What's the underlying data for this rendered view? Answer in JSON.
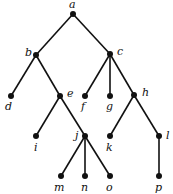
{
  "diagram": {
    "type": "rooted-tree",
    "root": "a",
    "nodes": [
      {
        "id": "a",
        "label": "a",
        "x": 73,
        "y": 14,
        "lx": 69,
        "ly": 8
      },
      {
        "id": "b",
        "label": "b",
        "x": 36,
        "y": 55,
        "lx": 25,
        "ly": 56
      },
      {
        "id": "c",
        "label": "c",
        "x": 110,
        "y": 54,
        "lx": 117,
        "ly": 55
      },
      {
        "id": "d",
        "label": "d",
        "x": 11,
        "y": 96,
        "lx": 5,
        "ly": 110
      },
      {
        "id": "e",
        "label": "e",
        "x": 60,
        "y": 96,
        "lx": 67,
        "ly": 97
      },
      {
        "id": "f",
        "label": "f",
        "x": 85,
        "y": 96,
        "lx": 81,
        "ly": 110
      },
      {
        "id": "g",
        "label": "g",
        "x": 110,
        "y": 96,
        "lx": 106,
        "ly": 110
      },
      {
        "id": "h",
        "label": "h",
        "x": 134,
        "y": 95,
        "lx": 142,
        "ly": 96
      },
      {
        "id": "i",
        "label": "i",
        "x": 36,
        "y": 136,
        "lx": 34,
        "ly": 151
      },
      {
        "id": "j",
        "label": "j",
        "x": 85,
        "y": 136,
        "lx": 75,
        "ly": 139
      },
      {
        "id": "k",
        "label": "k",
        "x": 110,
        "y": 136,
        "lx": 106,
        "ly": 151
      },
      {
        "id": "l",
        "label": "l",
        "x": 159,
        "y": 136,
        "lx": 166,
        "ly": 139
      },
      {
        "id": "m",
        "label": "m",
        "x": 61,
        "y": 176,
        "lx": 54,
        "ly": 191
      },
      {
        "id": "n",
        "label": "n",
        "x": 85,
        "y": 176,
        "lx": 81,
        "ly": 191
      },
      {
        "id": "o",
        "label": "o",
        "x": 110,
        "y": 176,
        "lx": 106,
        "ly": 191
      },
      {
        "id": "p",
        "label": "p",
        "x": 159,
        "y": 176,
        "lx": 155,
        "ly": 191
      }
    ],
    "edges": [
      [
        "a",
        "b"
      ],
      [
        "a",
        "c"
      ],
      [
        "b",
        "d"
      ],
      [
        "b",
        "e"
      ],
      [
        "c",
        "f"
      ],
      [
        "c",
        "g"
      ],
      [
        "c",
        "h"
      ],
      [
        "e",
        "i"
      ],
      [
        "e",
        "j"
      ],
      [
        "h",
        "k"
      ],
      [
        "h",
        "l"
      ],
      [
        "j",
        "m"
      ],
      [
        "j",
        "n"
      ],
      [
        "j",
        "o"
      ],
      [
        "l",
        "p"
      ]
    ],
    "colors": {
      "line": "#111111",
      "node": "#111111",
      "background": "#ffffff"
    }
  }
}
